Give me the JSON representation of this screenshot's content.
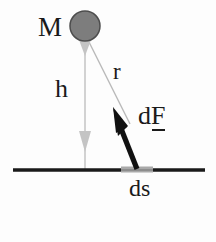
{
  "figure": {
    "background_color": "#fdfdfd",
    "labels": {
      "mass": "M",
      "height": "h",
      "distance": "r",
      "force_prefix": "d",
      "force_symbol": "F",
      "surface_element": "ds"
    },
    "colors": {
      "mass_fill": "#7d7d7d",
      "mass_stroke": "#4a4a4a",
      "ground_line": "#1a1a1a",
      "ds_segment": "#a8a8a8",
      "force_arrow": "#111111",
      "h_arrow": "#c9c9c9",
      "r_line": "#b5b5b5",
      "text": "#1a1a1a"
    },
    "geometry": {
      "mass_center": [
        85,
        26
      ],
      "mass_radius": 15,
      "ground_y": 170,
      "ground_x_start": 13,
      "ground_x_end": 205,
      "h_line_x": 85,
      "ds_x_start": 122,
      "ds_x_end": 152,
      "force_tip": [
        113,
        108
      ],
      "force_base": [
        137,
        168
      ],
      "r_start": [
        89,
        42
      ],
      "r_end": [
        128,
        120
      ]
    }
  }
}
